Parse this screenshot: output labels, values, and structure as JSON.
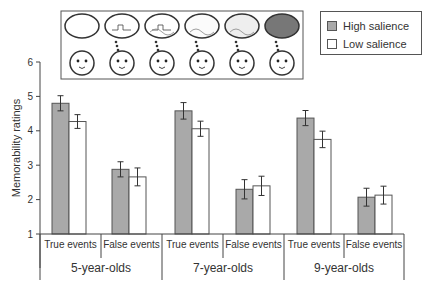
{
  "chart_data": {
    "type": "bar",
    "title": "",
    "xlabel": "",
    "ylabel": "Memorability ratings",
    "ylim": [
      1,
      6
    ],
    "yticks": [
      1,
      2,
      3,
      4,
      5,
      6
    ],
    "grid": false,
    "legend_position": "top-right",
    "categories": [
      "5-year-olds True events",
      "5-year-olds False events",
      "7-year-olds True events",
      "7-year-olds False events",
      "9-year-olds True events",
      "9-year-olds False events"
    ],
    "groups": [
      {
        "label": "5-year-olds",
        "subcategories": [
          "True events",
          "False events"
        ]
      },
      {
        "label": "7-year-olds",
        "subcategories": [
          "True events",
          "False events"
        ]
      },
      {
        "label": "9-year-olds",
        "subcategories": [
          "True events",
          "False events"
        ]
      }
    ],
    "series": [
      {
        "name": "High salience",
        "color": "#a9a9a9",
        "values": [
          4.8,
          2.88,
          4.58,
          2.3,
          4.37,
          2.07
        ],
        "errors": [
          0.22,
          0.22,
          0.24,
          0.28,
          0.22,
          0.26
        ]
      },
      {
        "name": "Low salience",
        "color": "#ffffff",
        "values": [
          4.27,
          2.66,
          4.06,
          2.4,
          3.75,
          2.13
        ],
        "errors": [
          0.2,
          0.26,
          0.22,
          0.28,
          0.24,
          0.26
        ]
      }
    ],
    "annotations": [
      "Inset illustration: six thought bubbles above child faces, progressively more detailed/darker from left to right"
    ]
  },
  "legend": {
    "items": [
      {
        "label": "High salience",
        "color": "#a9a9a9"
      },
      {
        "label": "Low salience",
        "color": "#ffffff"
      }
    ]
  }
}
